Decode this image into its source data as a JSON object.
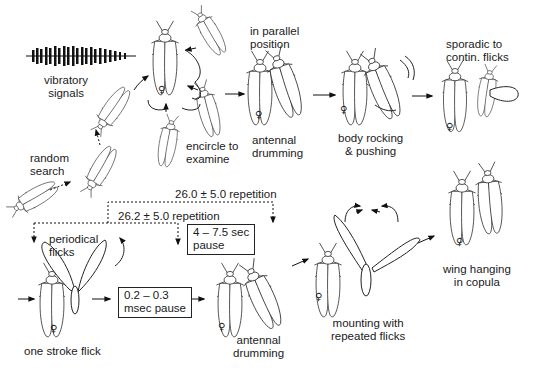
{
  "diagram": {
    "type": "behavioral sequence diagram",
    "female_symbol": "♀",
    "labels": {
      "vibratory_signals": "vibratory\nsignals",
      "random_search": "random\nsearch",
      "encircle": "encircle to\nexamine",
      "parallel": "in parallel\nposition",
      "antennal_top": "antennal\ndrumming",
      "rocking": "body rocking\n& pushing",
      "sporadic": "sporadic to\ncontin. flicks",
      "periodical": "periodical\nflicks",
      "one_stroke": "one stroke flick",
      "antennal_bottom": "antennal\ndrumming",
      "mounting": "mounting with\nrepeated flicks",
      "wing_hanging": "wing hanging\nin copula",
      "rep_outer": "26.0 ± 5.0 repetition",
      "rep_inner": "26.2 ± 5.0 repetition"
    },
    "boxes": {
      "short_pause": "0.2 – 0.3\nmsec pause",
      "long_pause": "4 – 7.5 sec\npause"
    },
    "colors": {
      "ink": "#222222",
      "background": "#ffffff"
    }
  }
}
